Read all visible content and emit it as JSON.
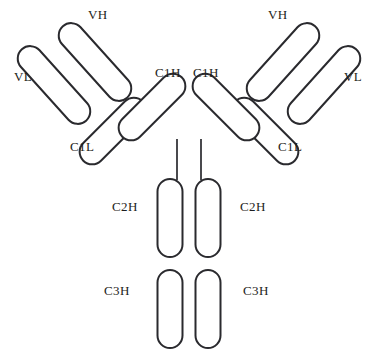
{
  "figure": {
    "kind": "antibody-structure-diagram",
    "width": 378,
    "height": 358,
    "background_color": "#ffffff",
    "stroke_color": "#2a2a2e",
    "fill_color": "#ffffff",
    "stroke_width": 2
  },
  "labels": {
    "left_vh": "VH",
    "left_vl": "VL",
    "left_c1h": "C1H",
    "left_c1l": "C1L",
    "left_c2h": "C2H",
    "left_c3h": "C3H",
    "right_vh": "VH",
    "right_vl": "VL",
    "right_c1h": "C1H",
    "right_c1l": "C1L",
    "right_c2h": "C2H",
    "right_c3h": "C3H"
  },
  "domains": {
    "left_vh": {
      "cx": 95,
      "cy": 62,
      "length": 96,
      "thickness": 25,
      "angle": 48
    },
    "left_vl": {
      "cx": 54,
      "cy": 85,
      "length": 96,
      "thickness": 25,
      "angle": 48
    },
    "left_c1h": {
      "cx": 152,
      "cy": 107,
      "length": 84,
      "thickness": 25,
      "angle": -45
    },
    "left_c1l": {
      "cx": 113,
      "cy": 131,
      "length": 84,
      "thickness": 25,
      "angle": -45
    },
    "left_c2h": {
      "cx": 170,
      "cy": 218,
      "length": 78,
      "thickness": 25,
      "angle": 90
    },
    "left_c3h": {
      "cx": 170,
      "cy": 309,
      "length": 78,
      "thickness": 25,
      "angle": 90
    },
    "right_vh": {
      "cx": 283,
      "cy": 62,
      "length": 96,
      "thickness": 25,
      "angle": -48
    },
    "right_vl": {
      "cx": 324,
      "cy": 85,
      "length": 96,
      "thickness": 25,
      "angle": -48
    },
    "right_c1h": {
      "cx": 226,
      "cy": 107,
      "length": 84,
      "thickness": 25,
      "angle": 45
    },
    "right_c1l": {
      "cx": 265,
      "cy": 131,
      "length": 84,
      "thickness": 25,
      "angle": 45
    },
    "right_c2h": {
      "cx": 208,
      "cy": 218,
      "length": 78,
      "thickness": 25,
      "angle": 90
    },
    "right_c3h": {
      "cx": 208,
      "cy": 309,
      "length": 78,
      "thickness": 25,
      "angle": 90
    }
  },
  "hinges": {
    "left": {
      "x1": 177,
      "y1": 139,
      "x2": 177,
      "y2": 180
    },
    "right": {
      "x1": 201,
      "y1": 139,
      "x2": 201,
      "y2": 180
    }
  },
  "label_positions": {
    "left_vh": {
      "x": 88,
      "y": 8
    },
    "left_vl": {
      "x": 14,
      "y": 70
    },
    "left_c1h": {
      "x": 155,
      "y": 66
    },
    "left_c1l": {
      "x": 70,
      "y": 140
    },
    "left_c2h": {
      "x": 112,
      "y": 200
    },
    "left_c3h": {
      "x": 104,
      "y": 284
    },
    "right_vh": {
      "x": 268,
      "y": 8
    },
    "right_vl": {
      "x": 344,
      "y": 70
    },
    "right_c1h": {
      "x": 193,
      "y": 66
    },
    "right_c1l": {
      "x": 278,
      "y": 140
    },
    "right_c2h": {
      "x": 240,
      "y": 200
    },
    "right_c3h": {
      "x": 243,
      "y": 284
    }
  }
}
